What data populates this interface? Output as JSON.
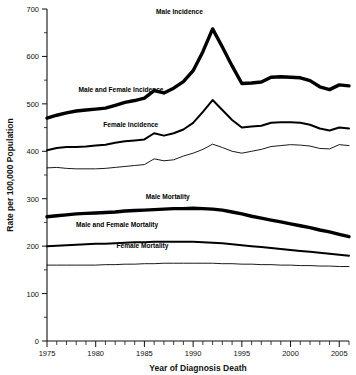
{
  "chart_data": {
    "type": "line",
    "title": "",
    "xlabel": "Year of Diagnosis Death",
    "ylabel": "Rate per 100,000 Population",
    "xlim": [
      1975,
      2006
    ],
    "ylim": [
      0,
      700
    ],
    "ytick_step": 100,
    "yminor_step": 50,
    "xtick_step": 5,
    "xminor_step": 1,
    "grid": false,
    "legend_position": "inline-annotations",
    "xticks": [
      "1975",
      "1980",
      "1985",
      "1990",
      "1995",
      "2000",
      "2005"
    ],
    "yticks": [
      "0",
      "100",
      "200",
      "300",
      "400",
      "500",
      "600",
      "700"
    ],
    "x": [
      1975,
      1976,
      1977,
      1978,
      1979,
      1980,
      1981,
      1982,
      1983,
      1984,
      1985,
      1986,
      1987,
      1988,
      1989,
      1990,
      1991,
      1992,
      1993,
      1994,
      1995,
      1996,
      1997,
      1998,
      1999,
      2000,
      2001,
      2002,
      2003,
      2004,
      2005,
      2006
    ],
    "series": [
      {
        "name": "Male Incidence",
        "label": "Male Incidence",
        "style": "thick",
        "label_x": 1988.6,
        "label_y": 690,
        "values": [
          470,
          476,
          481,
          485,
          487,
          489,
          491,
          497,
          503,
          507,
          512,
          528,
          523,
          533,
          547,
          570,
          610,
          658,
          620,
          580,
          543,
          544,
          546,
          556,
          557,
          556,
          555,
          549,
          536,
          530,
          540,
          538
        ]
      },
      {
        "name": "Male and Female Incidence",
        "label": "Male and Female Incidence",
        "style": "medium",
        "label_x": 1982.6,
        "label_y": 524,
        "values": [
          402,
          407,
          409,
          409,
          410,
          412,
          414,
          418,
          421,
          423,
          425,
          438,
          433,
          438,
          446,
          460,
          483,
          508,
          487,
          466,
          450,
          452,
          454,
          460,
          461,
          461,
          460,
          456,
          448,
          444,
          450,
          448
        ]
      },
      {
        "name": "Female Incidence",
        "label": "Female Incidence",
        "style": "thin",
        "label_x": 1983.6,
        "label_y": 452,
        "values": [
          365,
          366,
          364,
          363,
          363,
          363,
          364,
          366,
          368,
          370,
          372,
          384,
          380,
          382,
          390,
          396,
          404,
          415,
          408,
          400,
          396,
          400,
          404,
          410,
          412,
          414,
          413,
          411,
          406,
          405,
          414,
          412
        ]
      },
      {
        "name": "Male Mortality",
        "label": "Male Mortality",
        "style": "thick",
        "label_x": 1987.4,
        "label_y": 300,
        "values": [
          262,
          264,
          266,
          268,
          269,
          270,
          271,
          272,
          274,
          275,
          276,
          277,
          278,
          279,
          279,
          280,
          279,
          278,
          276,
          272,
          268,
          263,
          259,
          255,
          251,
          247,
          243,
          239,
          234,
          230,
          225,
          220
        ]
      },
      {
        "name": "Male and Female Mortality",
        "label": "Male and Female Mortality",
        "style": "medium",
        "label_x": 1982.2,
        "label_y": 240,
        "values": [
          200,
          201,
          202,
          203,
          204,
          205,
          205,
          206,
          207,
          208,
          208,
          209,
          209,
          209,
          209,
          209,
          208,
          207,
          206,
          204,
          202,
          200,
          198,
          196,
          194,
          192,
          190,
          188,
          186,
          184,
          182,
          180
        ]
      },
      {
        "name": "Female Mortality",
        "label": "Female Mortality",
        "style": "thin",
        "label_x": 1984.8,
        "label_y": 196,
        "values": [
          160,
          160,
          160,
          160,
          160,
          160,
          161,
          161,
          162,
          162,
          163,
          163,
          164,
          164,
          164,
          164,
          164,
          164,
          163,
          163,
          162,
          162,
          161,
          161,
          160,
          160,
          159,
          159,
          158,
          158,
          157,
          157
        ]
      }
    ]
  }
}
